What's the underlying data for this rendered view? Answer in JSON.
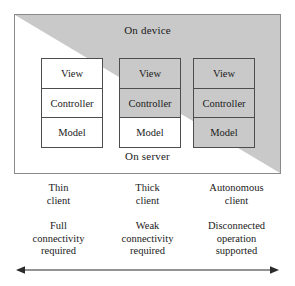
{
  "figure": {
    "zones": {
      "device_label": "On device",
      "server_label": "On server"
    },
    "stacks": [
      {
        "name": "thin-client-stack",
        "cells": [
          {
            "label": "View",
            "shaded": false
          },
          {
            "label": "Controller",
            "shaded": false
          },
          {
            "label": "Model",
            "shaded": false
          }
        ]
      },
      {
        "name": "thick-client-stack",
        "cells": [
          {
            "label": "View",
            "shaded": true
          },
          {
            "label": "Controller",
            "shaded": true
          },
          {
            "label": "Model",
            "shaded": false
          }
        ]
      },
      {
        "name": "autonomous-client-stack",
        "cells": [
          {
            "label": "View",
            "shaded": true
          },
          {
            "label": "Controller",
            "shaded": true
          },
          {
            "label": "Model",
            "shaded": true
          }
        ]
      }
    ],
    "columns": [
      {
        "title_line1": "Thin",
        "title_line2": "client",
        "desc_line1": "Full",
        "desc_line2": "connectivity",
        "desc_line3": "required"
      },
      {
        "title_line1": "Thick",
        "title_line2": "client",
        "desc_line1": "Weak",
        "desc_line2": "connectivity",
        "desc_line3": "required"
      },
      {
        "title_line1": "Autonomous",
        "title_line2": "client",
        "desc_line1": "Disconnected",
        "desc_line2": "operation",
        "desc_line3": "supported"
      }
    ],
    "axis_arrow": {
      "name": "connectivity-spectrum-arrow",
      "style": "double-headed-horizontal"
    },
    "colors": {
      "shade": "#c9c9c9",
      "box_border": "#8a8a8a",
      "cell_border": "#4d4d4d",
      "text": "#1a1a1a",
      "arrow": "#2b2b2b"
    }
  }
}
